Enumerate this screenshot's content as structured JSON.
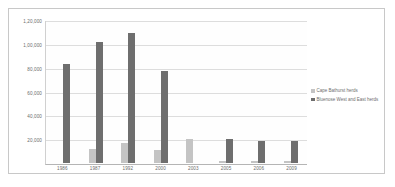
{
  "chart_data": {
    "type": "bar",
    "title": "",
    "xlabel": "",
    "ylabel": "",
    "categories": [
      "1986",
      "1987",
      "1992",
      "2000",
      "2003",
      "2005",
      "2006",
      "2009"
    ],
    "series": [
      {
        "name": "Cape Bathurst herds",
        "color": "#c4c4c4",
        "values": [
          0,
          12000,
          17000,
          11000,
          20000,
          2000,
          1500,
          1500
        ]
      },
      {
        "name": "Bluenose West and East herds",
        "color": "#6e6e6e",
        "values": [
          84000,
          102000,
          110000,
          78000,
          0,
          20000,
          19000,
          19000
        ]
      }
    ],
    "ylim": [
      0,
      120000
    ],
    "y_ticks": [
      0,
      20000,
      40000,
      60000,
      80000,
      100000,
      120000
    ],
    "y_tick_labels": [
      "0",
      "20,000",
      "40,000",
      "60,000",
      "80,000",
      "1,00,000",
      "1,20,000"
    ],
    "grid": true,
    "legend_position": "right"
  },
  "legend": {
    "entries": [
      {
        "label": "Cape Bathurst herds"
      },
      {
        "label": "Bluenose West and East herds"
      }
    ]
  }
}
